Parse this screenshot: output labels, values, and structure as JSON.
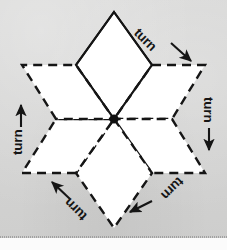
{
  "figure": {
    "background_color": "#d5d5d4",
    "ink_color": "#151515",
    "shape_fill_color": "#ffffff",
    "centre_marker": {
      "name": "centre-of-rotation",
      "x": 114,
      "y": 119,
      "color": "#101010"
    },
    "rhombi": [
      {
        "id": "rhombus-original-top",
        "line_style": "solid",
        "points": "114,12 152,65 114,119 76,65",
        "is_original": true
      },
      {
        "id": "rhombus-copy-upper-right",
        "line_style": "dashed",
        "points": "152,65 205,65 172,119 114,119",
        "is_original": false
      },
      {
        "id": "rhombus-copy-lower-right",
        "line_style": "dashed",
        "points": "172,119 205,173 152,173 114,119",
        "is_original": false
      },
      {
        "id": "rhombus-copy-bottom",
        "line_style": "dashed",
        "points": "114,119 152,173 114,228 76,173",
        "is_original": false
      },
      {
        "id": "rhombus-copy-lower-left",
        "line_style": "dashed",
        "points": "76,173 22,173 56,119 114,119",
        "is_original": false
      },
      {
        "id": "rhombus-copy-upper-left",
        "line_style": "dashed",
        "points": "56,119 22,65 76,65 114,119",
        "is_original": false
      }
    ],
    "labels": [
      {
        "id": "turn-label-upper-right",
        "text": "turn",
        "x": 163,
        "y": 38,
        "rotation_deg": 45,
        "arrow_direction": "down-right"
      },
      {
        "id": "turn-label-right",
        "text": "turn",
        "x": 213,
        "y": 108,
        "rotation_deg": 90,
        "arrow_direction": "down"
      },
      {
        "id": "turn-label-lower-right",
        "text": "turn",
        "x": 170,
        "y": 203,
        "rotation_deg": 135,
        "arrow_direction": "down-left"
      },
      {
        "id": "turn-label-lower-left",
        "text": "turn",
        "x": 62,
        "y": 205,
        "rotation_deg": 225,
        "arrow_direction": "up-left"
      },
      {
        "id": "turn-label-left",
        "text": "turn",
        "x": 16,
        "y": 131,
        "rotation_deg": 270,
        "arrow_direction": "up"
      }
    ],
    "arrows": [
      {
        "id": "arrow-upper-right",
        "x1": 171,
        "y1": 43,
        "x2": 192,
        "y2": 62
      },
      {
        "id": "arrow-right",
        "x1": 209,
        "y1": 128,
        "x2": 209,
        "y2": 152
      },
      {
        "id": "arrow-lower-right",
        "x1": 152,
        "y1": 201,
        "x2": 128,
        "y2": 213
      },
      {
        "id": "arrow-lower-left",
        "x1": 70,
        "y1": 199,
        "x2": 50,
        "y2": 181
      },
      {
        "id": "arrow-left",
        "x1": 21,
        "y1": 127,
        "x2": 21,
        "y2": 103
      }
    ]
  }
}
